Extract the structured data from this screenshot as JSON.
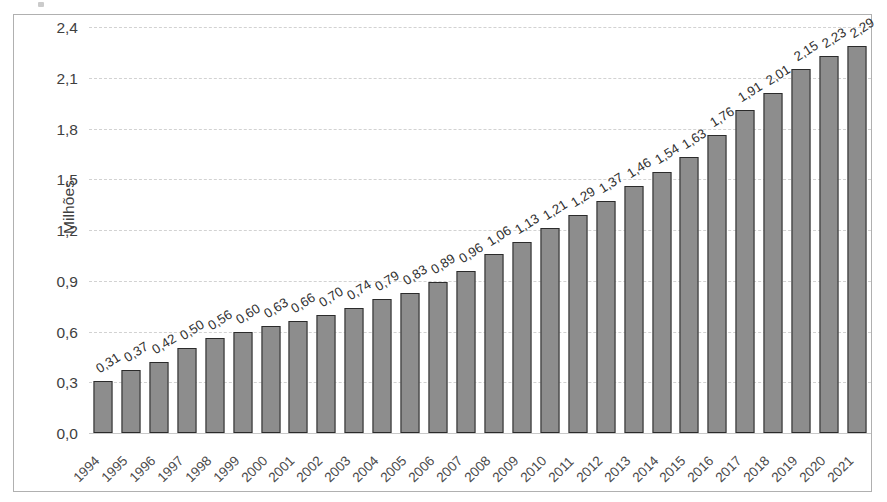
{
  "chart_data": {
    "type": "bar",
    "title": "",
    "xlabel": "",
    "ylabel": "Milhões",
    "ylim": [
      0,
      2.4
    ],
    "yticks": [
      "0,0",
      "0,3",
      "0,6",
      "0,9",
      "1,2",
      "1,5",
      "1,8",
      "2,1",
      "2,4"
    ],
    "ytick_values": [
      0.0,
      0.3,
      0.6,
      0.9,
      1.2,
      1.5,
      1.8,
      2.1,
      2.4
    ],
    "grid": true,
    "legend": "none",
    "decimal_separator": ",",
    "categories": [
      "1994",
      "1995",
      "1996",
      "1997",
      "1998",
      "1999",
      "2000",
      "2001",
      "2002",
      "2003",
      "2004",
      "2005",
      "2006",
      "2007",
      "2008",
      "2009",
      "2010",
      "2011",
      "2012",
      "2013",
      "2014",
      "2015",
      "2016",
      "2017",
      "2018",
      "2019",
      "2020",
      "2021"
    ],
    "values": [
      0.31,
      0.37,
      0.42,
      0.5,
      0.56,
      0.6,
      0.63,
      0.66,
      0.7,
      0.74,
      0.79,
      0.83,
      0.89,
      0.96,
      1.06,
      1.13,
      1.21,
      1.29,
      1.37,
      1.46,
      1.54,
      1.63,
      1.76,
      1.91,
      2.01,
      2.15,
      2.23,
      2.29
    ],
    "data_labels": [
      "0,31",
      "0,37",
      "0,42",
      "0,50",
      "0,56",
      "0,60",
      "0,63",
      "0,66",
      "0,70",
      "0,74",
      "0,79",
      "0,83",
      "0,89",
      "0,96",
      "1,06",
      "1,13",
      "1,21",
      "1,29",
      "1,37",
      "1,46",
      "1,54",
      "1,63",
      "1,76",
      "1,91",
      "2,01",
      "2,15",
      "2,23",
      "2,29"
    ],
    "bar_fill_color": "#8d8d8d",
    "bar_border_color": "#2b2b2b",
    "gridline_color": "#d2d2d2",
    "frame_color": "#b0b0b0",
    "text_color": "#3f3f3f"
  }
}
